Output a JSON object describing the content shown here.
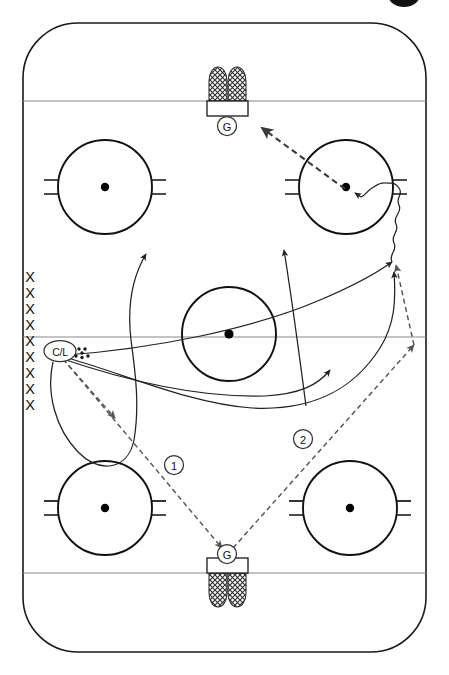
{
  "diagram": {
    "sport": "ice-hockey",
    "view": "full-sheet-vertical",
    "rink": {
      "surface_color": "#ffffff",
      "border_color": "#1a1a1a",
      "line_color": "#8a8a8a",
      "mark_color": "#111111"
    },
    "goalies": [
      {
        "id": "goalie-top",
        "label": "G",
        "x": 227,
        "y": 126,
        "end": "top"
      },
      {
        "id": "goalie-bottom",
        "label": "G",
        "x": 227,
        "y": 554,
        "end": "bottom"
      }
    ],
    "nets": [
      {
        "id": "net-top",
        "x": 227,
        "y": 90,
        "end": "top"
      },
      {
        "id": "net-bottom",
        "x": 227,
        "y": 583,
        "end": "bottom"
      }
    ],
    "faceoff_circles": [
      {
        "id": "faceoff-top-left",
        "cx": 105,
        "cy": 187,
        "r": 47,
        "hash": true
      },
      {
        "id": "faceoff-top-right",
        "cx": 346,
        "cy": 187,
        "r": 47,
        "hash": true
      },
      {
        "id": "faceoff-center",
        "cx": 229,
        "cy": 334,
        "r": 47,
        "hash": false
      },
      {
        "id": "faceoff-bottom-left",
        "cx": 105,
        "cy": 508,
        "r": 47,
        "hash": true
      },
      {
        "id": "faceoff-bottom-right",
        "cx": 350,
        "cy": 508,
        "r": 47,
        "hash": true
      }
    ],
    "ice_lines": [
      {
        "id": "goal-line-top",
        "y": 101,
        "kind": "goal-line"
      },
      {
        "id": "center-line",
        "y": 337,
        "kind": "center-line"
      },
      {
        "id": "goal-line-bottom",
        "y": 573,
        "kind": "goal-line"
      }
    ],
    "player_queue": {
      "id": "player-queue-left",
      "symbol": "X",
      "count": 9,
      "x": 30,
      "y_start": 277,
      "y_step": 16
    },
    "coach_marker": {
      "id": "coach-line-marker",
      "label": "C/L",
      "x": 60,
      "y": 351
    },
    "puck_pile": {
      "id": "puck-pile",
      "label": "pucks",
      "x": 83,
      "y": 353
    },
    "sequence_markers": [
      {
        "id": "step-1",
        "label": "1",
        "x": 174,
        "y": 465
      },
      {
        "id": "step-2",
        "label": "2",
        "x": 303,
        "y": 439
      }
    ],
    "legend_notes": {
      "solid_line": "skating path",
      "dashed_line": "pass",
      "wavy_line": "puck carry",
      "x_symbol": "player",
      "g_symbol": "goaltender",
      "cl_symbol": "coach / line"
    }
  }
}
